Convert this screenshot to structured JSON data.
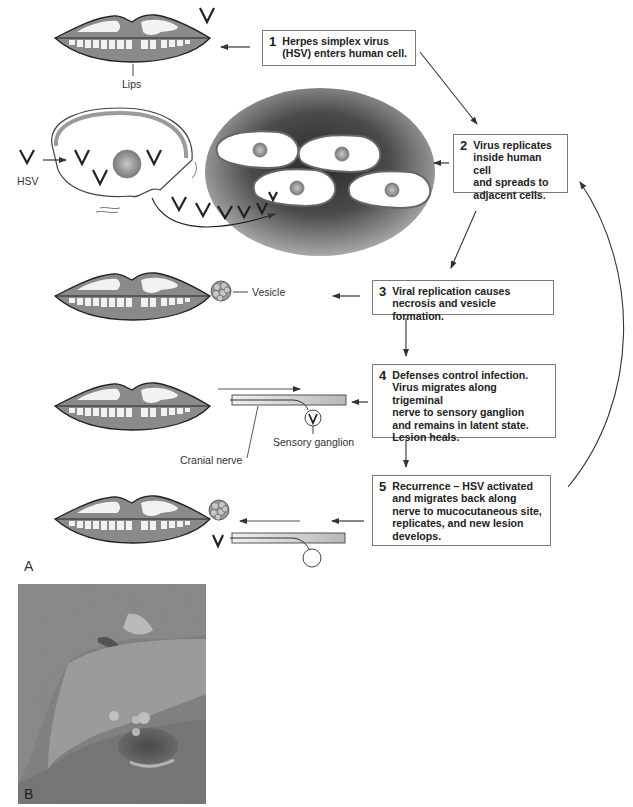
{
  "figure": {
    "panel_a_label": "A",
    "panel_b_label": "B"
  },
  "steps": [
    {
      "num": "1",
      "text": "Herpes simplex virus\n(HSV) enters human cell."
    },
    {
      "num": "2",
      "text": "Virus replicates\ninside human cell\nand spreads to\nadjacent cells."
    },
    {
      "num": "3",
      "text": "Viral replication causes\nnecrosis and vesicle formation."
    },
    {
      "num": "4",
      "text": "Defenses control infection.\nVirus migrates along trigeminal\nnerve to sensory ganglion\nand remains in latent state.\nLesion heals."
    },
    {
      "num": "5",
      "text": "Recurrence – HSV activated\nand migrates back along\nnerve to mucocutaneous site,\nreplicates, and new lesion\ndevelops."
    }
  ],
  "labels": {
    "lips": "Lips",
    "hsv": "HSV",
    "vesicle": "Vesicle",
    "cranial_nerve": "Cranial nerve",
    "sensory_ganglion": "Sensory ganglion"
  },
  "icons": {
    "virus": "virus-v-glyph",
    "cell": "human-cell",
    "lips": "lips-illustration",
    "vesicle": "vesicle-cluster",
    "nerve": "cranial-nerve",
    "ganglion": "sensory-ganglion"
  },
  "colors": {
    "lip_fill": "#8a8a8a",
    "tissue_dark": "#3c3c3c",
    "tissue_light": "#9a9a9a",
    "box_border": "#7a7a7a",
    "arrow": "#333333"
  }
}
